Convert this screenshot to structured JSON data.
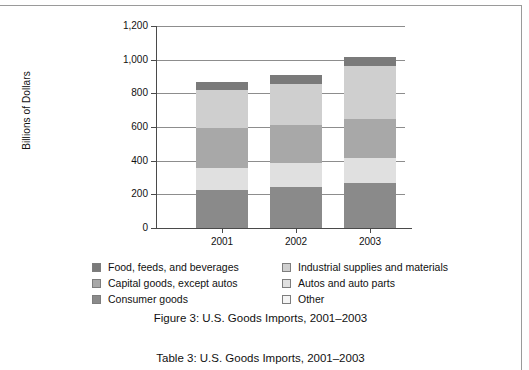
{
  "figure": {
    "caption": "Figure 3:  U.S. Goods Imports, 2001–2003",
    "table_caption": "Table 3:  U.S. Goods Imports, 2001–2003"
  },
  "chart_data": {
    "type": "bar",
    "stacked": true,
    "title": "Figure 3:  U.S. Goods Imports, 2001–2003",
    "xlabel": "",
    "ylabel": "Billions of Dollars",
    "categories": [
      "2001",
      "2002",
      "2003"
    ],
    "ylim": [
      0,
      1200
    ],
    "yticks": [
      0,
      200,
      400,
      600,
      800,
      1000,
      1200
    ],
    "ytick_labels": [
      "0",
      "200",
      "400",
      "600",
      "800",
      "1,000",
      "1,200"
    ],
    "grid": true,
    "legend_position": "below",
    "series": [
      {
        "name": "Consumer goods",
        "color": "#8a8a8a",
        "values": [
          226,
          245,
          270
        ]
      },
      {
        "name": "Autos and auto parts",
        "color": "#e0e0e0",
        "values": [
          133,
          139,
          147
        ]
      },
      {
        "name": "Capital goods, except autos",
        "color": "#a8a8a8",
        "values": [
          236,
          227,
          230
        ]
      },
      {
        "name": "Industrial supplies and materials",
        "color": "#cfcfcf",
        "values": [
          228,
          247,
          313
        ]
      },
      {
        "name": "Food, feeds, and beverages",
        "color": "#7a7a7a",
        "values": [
          46,
          49,
          56
        ]
      }
    ],
    "totals": [
      869,
      907,
      1016
    ],
    "annotations": []
  },
  "axis": {
    "y_title": "Billions of Dollars",
    "y_tick_labels": [
      "1,200",
      "1,000",
      "800",
      "600",
      "400",
      "200",
      "0"
    ],
    "x_tick_labels": [
      "2001",
      "2002",
      "2003"
    ]
  },
  "legend": {
    "column_left": [
      {
        "label": "Food, feeds, and beverages",
        "color": "#7a7a7a"
      },
      {
        "label": "Capital goods, except autos",
        "color": "#a8a8a8"
      },
      {
        "label": "Consumer goods",
        "color": "#8a8a8a"
      }
    ],
    "column_right": [
      {
        "label": "Industrial supplies and materials",
        "color": "#cfcfcf"
      },
      {
        "label": "Autos and auto parts",
        "color": "#e0e0e0"
      },
      {
        "label": "Other",
        "color": "#f4f4f4"
      }
    ]
  },
  "colors": {
    "axis": "#4a4a4a",
    "grid": "#8d8d8d",
    "rule": "#9a9a9a",
    "text": "#111111"
  }
}
